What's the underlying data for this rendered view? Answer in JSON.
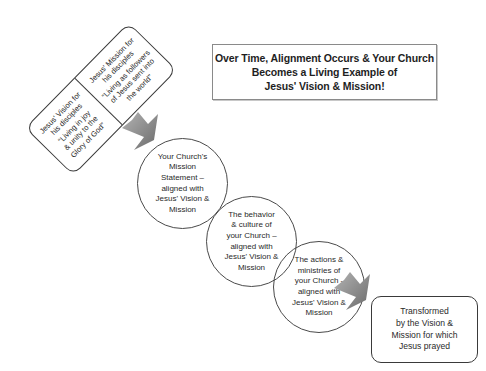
{
  "diagram": {
    "title_box": {
      "lines": [
        "Over Time, Alignment Occurs & Your Church",
        "Becomes a Living Example of",
        "Jesus' Vision & Mission!"
      ]
    },
    "rotated_box": {
      "left_panel": {
        "heading_lines": [
          "Jesus' Vision for",
          "his disciples"
        ],
        "quote_lines": [
          "“Living in joy",
          "& unity to the",
          "Glory of God”"
        ]
      },
      "right_panel": {
        "heading_lines": [
          "Jesus' Mission for",
          "his disciples"
        ],
        "quote_lines": [
          "“Living as followers",
          "of Jesus sent into",
          "the world”"
        ]
      }
    },
    "circles": [
      {
        "lines": [
          "Your Church's",
          "Mission",
          "Statement –",
          "aligned with",
          "Jesus' Vision &",
          "Mission"
        ]
      },
      {
        "lines": [
          "The behavior",
          "& culture of",
          "your Church –",
          "aligned with",
          "Jesus' Vision &",
          "Mission"
        ]
      },
      {
        "lines": [
          "The actions &",
          "ministries of",
          "your Church -",
          "aligned with",
          "Jesus' Vision &",
          "Mission"
        ]
      }
    ],
    "final_box": {
      "lines": [
        "Transformed",
        "by the Vision &",
        "Mission for which",
        "Jesus prayed"
      ]
    },
    "arrows": [
      {
        "name": "arrow-to-circles",
        "direction": "down-right"
      },
      {
        "name": "arrow-to-final",
        "direction": "down-right"
      }
    ],
    "colors": {
      "border": "#3a3a3a",
      "title_border": "#8a8a8a",
      "arrow_fill_light": "#a8a8a8",
      "arrow_fill_dark": "#6e6e6e",
      "text": "#222222",
      "background": "#ffffff"
    }
  }
}
